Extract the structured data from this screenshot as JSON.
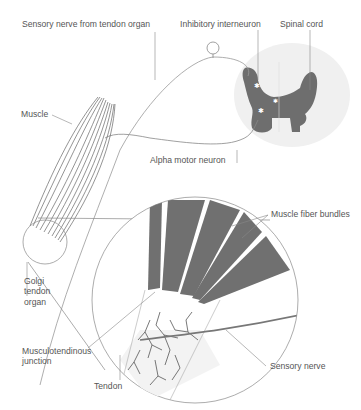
{
  "labels": {
    "sensory_nerve_from_tendon_organ": "Sensory nerve from tendon organ",
    "inhibitory_interneuron": "Inhibitory interneuron",
    "spinal_cord": "Spinal cord",
    "muscle": "Muscle",
    "alpha_motor_neuron": "Alpha motor neuron",
    "muscle_fiber_bundles": "Muscle fiber bundles",
    "golgi_line1": "Golgi",
    "golgi_line2": "tendon",
    "golgi_line3": "organ",
    "mtj_line1": "Musculotendinous",
    "mtj_line2": "junction",
    "tendon": "Tendon",
    "sensory_nerve": "Sensory nerve"
  },
  "colors": {
    "gray_matter": "#6e6e6e",
    "white_matter": "#f0f0f0",
    "muscle_fibers": "#707070",
    "tendon_fill": "#f3f3f3",
    "lines": "#888888",
    "text": "#555555"
  }
}
